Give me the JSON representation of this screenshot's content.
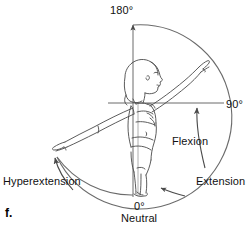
{
  "figure": {
    "panel_label": "f.",
    "joint": "shoulder",
    "motion_plane": "sagittal",
    "labels": {
      "apex": "180°",
      "right": "90°",
      "origin": "0°",
      "origin_name": "Neutral",
      "flexion": "Flexion",
      "extension": "Extension",
      "hyperextension": "Hyperextension"
    },
    "icons": {
      "axis_up_arrow": "arrow-up-icon",
      "flexion_arrow": "curved-arrow-up-icon",
      "extension_arrow": "curved-arrow-left-icon",
      "hyperextension_arrow": "curved-arrow-up-left-icon"
    },
    "colors": {
      "line": "#5a5a5a",
      "body_line": "#4a4a4a",
      "text": "#111111",
      "background": "#ffffff"
    }
  }
}
